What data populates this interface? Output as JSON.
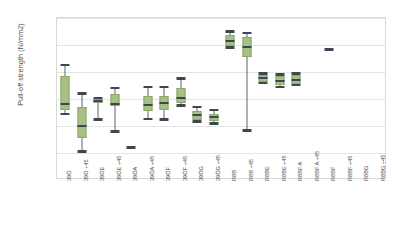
{
  "chart_data": {
    "type": "boxplot",
    "title": "",
    "xlabel": "",
    "ylabel": "Pull-off strength (N/mm2)",
    "ylim": [
      0.5,
      3.5
    ],
    "ytick_labels": [
      "3,5",
      "3,0",
      "2,5",
      "2,0",
      "1,5",
      "1,0",
      "0,5"
    ],
    "ytick_values": [
      3.5,
      3.0,
      2.5,
      2.0,
      1.5,
      1.0,
      0.5
    ],
    "grid": true,
    "legend": "none",
    "categories": [
      "39Ö",
      "39Ö +45",
      "39ÖE",
      "39ÖE +45",
      "39ÖA",
      "39ÖA +45",
      "39ÖF",
      "39ÖF +45",
      "39ÖG",
      "39ÖG +45",
      "R8B",
      "R8B +45",
      "R8BE",
      "R8BE +45",
      "R8BF A",
      "R8BF A +45",
      "R8BF",
      "R8BF +45",
      "R8BG",
      "R8BG +45"
    ],
    "boxes": [
      {
        "category": "39Ö",
        "whisker_low": 1.72,
        "q1": 1.8,
        "median": 1.9,
        "q3": 2.42,
        "whisker_high": 2.63
      },
      {
        "category": "39Ö +45",
        "whisker_low": 1.03,
        "q1": 1.27,
        "median": 1.5,
        "q3": 1.85,
        "whisker_high": 2.1
      },
      {
        "category": "39ÖE",
        "whisker_low": 1.62,
        "q1": 1.93,
        "median": 1.96,
        "q3": 2.0,
        "whisker_high": 2.02
      },
      {
        "category": "39ÖE +45",
        "whisker_low": 1.4,
        "q1": 1.87,
        "median": 1.9,
        "q3": 2.1,
        "whisker_high": 2.2
      },
      {
        "category": "39ÖA",
        "whisker_low": 1.1,
        "q1": 1.1,
        "median": 1.1,
        "q3": 1.12,
        "whisker_high": 1.12,
        "single_point": true
      },
      {
        "category": "39ÖA +45",
        "whisker_low": 1.63,
        "q1": 1.78,
        "median": 1.88,
        "q3": 2.05,
        "whisker_high": 2.22
      },
      {
        "category": "39ÖF",
        "whisker_low": 1.62,
        "q1": 1.8,
        "median": 1.93,
        "q3": 2.05,
        "whisker_high": 2.22
      },
      {
        "category": "39ÖF +45",
        "whisker_low": 1.88,
        "q1": 1.92,
        "median": 2.02,
        "q3": 2.2,
        "whisker_high": 2.38
      },
      {
        "category": "39ÖG",
        "whisker_low": 1.58,
        "q1": 1.62,
        "median": 1.7,
        "q3": 1.78,
        "whisker_high": 1.85
      },
      {
        "category": "39ÖG +45",
        "whisker_low": 1.55,
        "q1": 1.6,
        "median": 1.66,
        "q3": 1.72,
        "whisker_high": 1.8
      },
      {
        "category": "R8B",
        "whisker_low": 2.95,
        "q1": 2.98,
        "median": 3.08,
        "q3": 3.18,
        "whisker_high": 3.25
      },
      {
        "category": "R8B +45",
        "whisker_low": 1.42,
        "q1": 2.78,
        "median": 2.96,
        "q3": 3.15,
        "whisker_high": 3.22
      },
      {
        "category": "R8BE",
        "whisker_low": 2.3,
        "q1": 2.32,
        "median": 2.38,
        "q3": 2.45,
        "whisker_high": 2.47
      },
      {
        "category": "R8BE +45",
        "whisker_low": 2.22,
        "q1": 2.25,
        "median": 2.33,
        "q3": 2.42,
        "whisker_high": 2.45
      },
      {
        "category": "R8BF A",
        "whisker_low": 2.26,
        "q1": 2.28,
        "median": 2.36,
        "q3": 2.45,
        "whisker_high": 2.47
      },
      {
        "category": "R8BF A +45",
        "whisker_low": null,
        "q1": null,
        "median": null,
        "q3": null,
        "whisker_high": null
      },
      {
        "category": "R8BF",
        "whisker_low": 2.9,
        "q1": 2.9,
        "median": 2.92,
        "q3": 2.93,
        "whisker_high": 2.93,
        "single_point": true
      },
      {
        "category": "R8BF +45",
        "whisker_low": null,
        "q1": null,
        "median": null,
        "q3": null,
        "whisker_high": null
      },
      {
        "category": "R8BG",
        "whisker_low": null,
        "q1": null,
        "median": null,
        "q3": null,
        "whisker_high": null
      },
      {
        "category": "R8BG +45",
        "whisker_low": null,
        "q1": null,
        "median": null,
        "q3": null,
        "whisker_high": null
      }
    ],
    "colors": {
      "box_fill": "#a7c083",
      "box_edge": "#8aa86a",
      "median": "#3d4653",
      "whisker": "#5d6470",
      "grid": "#e4e4e4",
      "frame": "#d9d9d9",
      "text": "#4a4a4a",
      "background": "#ffffff"
    }
  }
}
